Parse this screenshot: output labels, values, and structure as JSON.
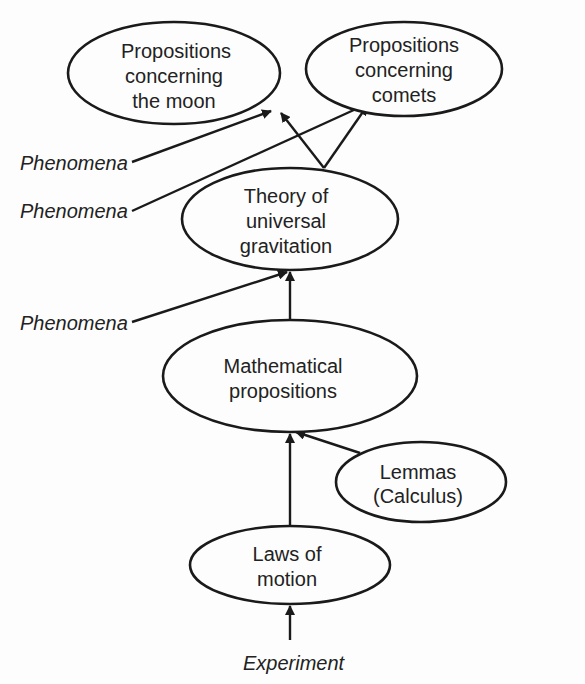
{
  "diagram": {
    "type": "flow-hierarchy",
    "nodes": [
      {
        "id": "moon",
        "lines": [
          "Propositions",
          "concerning",
          "the moon"
        ]
      },
      {
        "id": "comets",
        "lines": [
          "Propositions",
          "concerning",
          "comets"
        ]
      },
      {
        "id": "theory",
        "lines": [
          "Theory of",
          "universal",
          "gravitation"
        ]
      },
      {
        "id": "math",
        "lines": [
          "Mathematical",
          "propositions"
        ]
      },
      {
        "id": "lemmas",
        "lines": [
          "Lemmas",
          "(Calculus)"
        ]
      },
      {
        "id": "laws",
        "lines": [
          "Laws of",
          "motion"
        ]
      }
    ],
    "inputs": [
      {
        "id": "phen1",
        "label": "Phenomena",
        "target": "moon"
      },
      {
        "id": "phen2",
        "label": "Phenomena",
        "target": "comets"
      },
      {
        "id": "phen3",
        "label": "Phenomena",
        "target": "theory"
      },
      {
        "id": "exp",
        "label": "Experiment",
        "target": "laws"
      }
    ],
    "edges": [
      {
        "from": "theory",
        "to": "moon"
      },
      {
        "from": "theory",
        "to": "comets"
      },
      {
        "from": "math",
        "to": "theory"
      },
      {
        "from": "laws",
        "to": "math"
      },
      {
        "from": "lemmas",
        "to": "math"
      },
      {
        "from": "phen1",
        "to": "moon"
      },
      {
        "from": "phen2",
        "to": "comets"
      },
      {
        "from": "phen3",
        "to": "theory"
      },
      {
        "from": "exp",
        "to": "laws"
      }
    ],
    "colors": {
      "stroke": "#1a1a1a",
      "text": "#222222",
      "background": "#fdfdfd"
    }
  }
}
